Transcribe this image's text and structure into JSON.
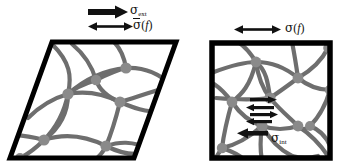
{
  "figure": {
    "background_color": "#ffffff",
    "panels": [
      {
        "id": "left",
        "shape": "parallelogram",
        "description": "sheared fiber network cell under external shear stress",
        "border_color": "#000000",
        "fiber_color": "#6e6e6e",
        "node_color": "#8a8a8a",
        "labels": [
          {
            "name": "sigma-ext",
            "sigma": "σ",
            "subscript": "ext",
            "arrow": "single-right",
            "arrow_weight": "thick"
          },
          {
            "name": "sigma-f-bar",
            "sigma": "σ",
            "overbar": true,
            "argument": "(f)",
            "arrow": "double-headed",
            "arrow_weight": "thin"
          }
        ]
      },
      {
        "id": "right",
        "shape": "square",
        "description": "relaxed square fiber network cell with internal stress",
        "border_color": "#000000",
        "fiber_color": "#6e6e6e",
        "node_color": "#8a8a8a",
        "labels": [
          {
            "name": "sigma-f",
            "sigma": "σ",
            "argument": "(f)",
            "arrow": "double-headed",
            "arrow_weight": "thin"
          },
          {
            "name": "sigma-int",
            "sigma": "σ",
            "subscript": "int",
            "arrow": "single-left",
            "arrow_weight": "thick"
          }
        ]
      }
    ],
    "annotations": {
      "internal_arrow_stack_count": 4,
      "internal_arrow_pair": "opposing-horizontal"
    }
  },
  "text": {
    "sigma_glyph": "σ",
    "ext_sub": "ext",
    "int_sub": "int",
    "f_arg_open": "(",
    "f_arg_letter": "f",
    "f_arg_close": ")"
  }
}
